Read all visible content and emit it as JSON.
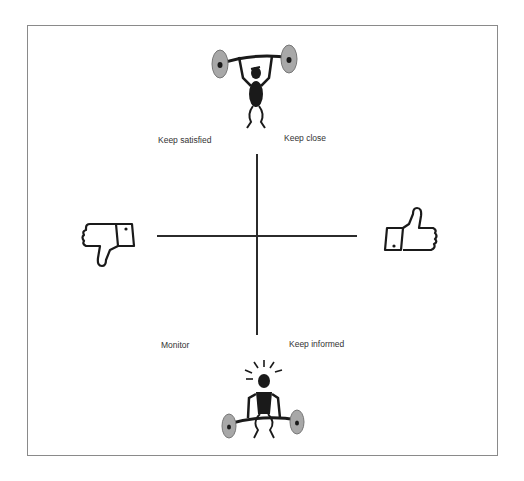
{
  "diagram": {
    "type": "stakeholder-matrix",
    "quadrants": {
      "top_left": "Keep satisfied",
      "top_right": "Keep close",
      "bottom_left": "Monitor",
      "bottom_right": "Keep informed"
    },
    "axis_icons": {
      "top": "weightlifter-overhead-icon",
      "bottom": "weightlifter-struggling-icon",
      "left": "thumbs-down-icon",
      "right": "thumbs-up-icon"
    },
    "colors": {
      "line": "#2b2b2b",
      "frame": "#8a8a8a",
      "plate": "#a8a8a8",
      "figure": "#1a1a1a"
    }
  }
}
